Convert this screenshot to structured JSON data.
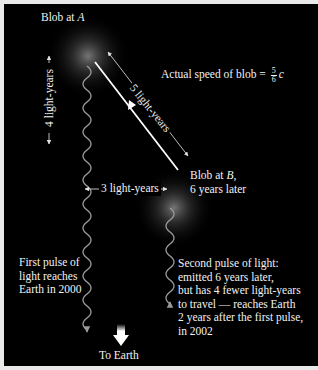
{
  "diagram": {
    "colors": {
      "background": "#000000",
      "frame": "#e9e9e9",
      "text": "#f2f2f2",
      "wave": "#9a9a9a",
      "arrow": "#ffffff"
    },
    "labels": {
      "blob_a_prefix": "Blob at ",
      "blob_a_point": "A",
      "blob_b_prefix": "Blob at ",
      "blob_b_point": "B",
      "blob_b_suffix": ",",
      "blob_b_line2": "6 years later",
      "speed_prefix": "Actual speed of blob = ",
      "speed_numerator": "5",
      "speed_denominator": "6",
      "speed_unit": "c",
      "vertical_distance": "4 light-years",
      "diagonal_distance": "5 light-years",
      "horizontal_distance": "3 light-years",
      "first_pulse": [
        "First pulse of",
        "light reaches",
        "Earth in 2000"
      ],
      "second_pulse": [
        "Second pulse of light:",
        "emitted 6 years later,",
        "but has 4 fewer light-years",
        "to travel — reaches Earth",
        "2 years after the first pulse,",
        "in 2002"
      ],
      "to_earth": "To Earth"
    },
    "icons": {
      "to_earth_arrow": "down-arrow-icon",
      "distance_arrows": "double-headed-arrow-icon"
    }
  }
}
